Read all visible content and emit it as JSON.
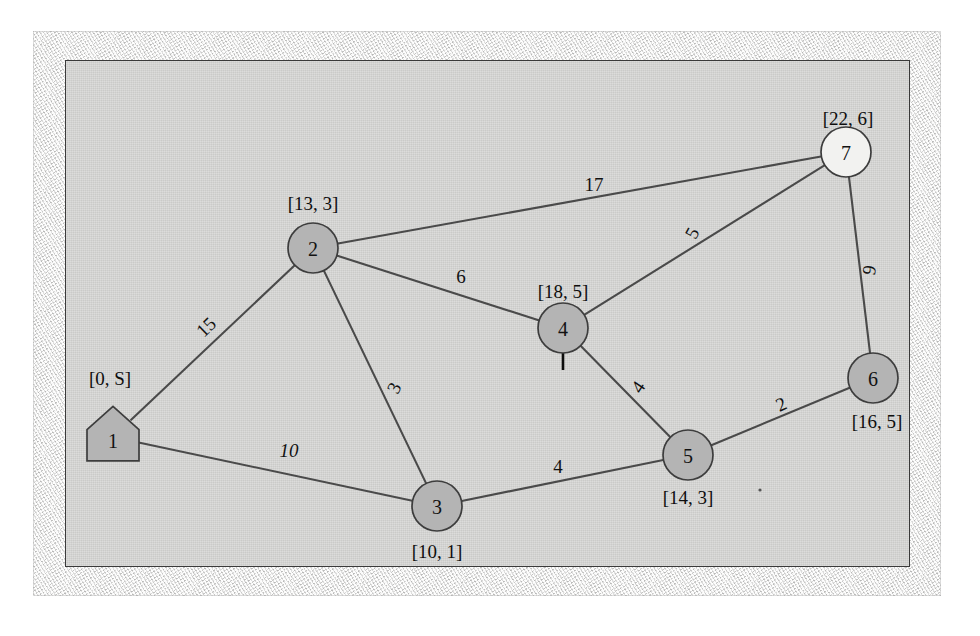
{
  "figure": {
    "kind": "weighted-undirected-graph",
    "caption": "",
    "colors": {
      "node_fill": "#b4b4b4",
      "node_open_fill": "#f2f2f0",
      "node_stroke": "#3d3d3d",
      "edge_stroke": "#4a4a4a",
      "plate_background": "#d4d4d2",
      "frame_background": "#e9e9e7",
      "text": "#111111"
    }
  },
  "chart_data": {
    "type": "diagram",
    "title": "",
    "nodes": [
      {
        "id": "1",
        "label": "1",
        "annotation": "[0, S]",
        "shape": "pentagon",
        "fill": "shaded",
        "x": 113,
        "y": 437,
        "r": 26,
        "annotation_x": 110,
        "annotation_y": 378
      },
      {
        "id": "2",
        "label": "2",
        "annotation": "[13, 3]",
        "shape": "circle",
        "fill": "shaded",
        "x": 313,
        "y": 248,
        "r": 25,
        "annotation_x": 313,
        "annotation_y": 203
      },
      {
        "id": "3",
        "label": "3",
        "annotation": "[10, 1]",
        "shape": "circle",
        "fill": "shaded",
        "x": 437,
        "y": 506,
        "r": 25,
        "annotation_x": 437,
        "annotation_y": 551
      },
      {
        "id": "4",
        "label": "4",
        "annotation": "[18, 5]",
        "shape": "circle",
        "fill": "shaded",
        "x": 563,
        "y": 328,
        "r": 25,
        "annotation_x": 563,
        "annotation_y": 291
      },
      {
        "id": "5",
        "label": "5",
        "annotation": "[14, 3]",
        "shape": "circle",
        "fill": "shaded",
        "x": 688,
        "y": 455,
        "r": 25,
        "annotation_x": 688,
        "annotation_y": 497
      },
      {
        "id": "6",
        "label": "6",
        "annotation": "[16, 5]",
        "shape": "circle",
        "fill": "shaded",
        "x": 873,
        "y": 378,
        "r": 25,
        "annotation_x": 877,
        "annotation_y": 421
      },
      {
        "id": "7",
        "label": "7",
        "annotation": "[22, 6]",
        "shape": "circle",
        "fill": "open",
        "x": 846,
        "y": 152,
        "r": 25,
        "annotation_x": 848,
        "annotation_y": 118
      }
    ],
    "edges": [
      {
        "source": "1",
        "target": "2",
        "weight": "15",
        "label_x": 206,
        "label_y": 327,
        "rotation": -44,
        "italic": false
      },
      {
        "source": "1",
        "target": "3",
        "weight": "10",
        "label_x": 289,
        "label_y": 450,
        "rotation": 0,
        "italic": true
      },
      {
        "source": "2",
        "target": "3",
        "weight": "3",
        "label_x": 394,
        "label_y": 388,
        "rotation": -64,
        "italic": false
      },
      {
        "source": "2",
        "target": "4",
        "weight": "6",
        "label_x": 461,
        "label_y": 276,
        "rotation": 0,
        "italic": false
      },
      {
        "source": "2",
        "target": "7",
        "weight": "17",
        "label_x": 594,
        "label_y": 184,
        "rotation": 0,
        "italic": false
      },
      {
        "source": "4",
        "target": "7",
        "weight": "5",
        "label_x": 692,
        "label_y": 233,
        "rotation": -62,
        "italic": false
      },
      {
        "source": "7",
        "target": "6",
        "weight": "9",
        "label_x": 869,
        "label_y": 270,
        "rotation": -81,
        "italic": false
      },
      {
        "source": "4",
        "target": "5",
        "weight": "4",
        "label_x": 638,
        "label_y": 387,
        "rotation": -56,
        "italic": false
      },
      {
        "source": "3",
        "target": "5",
        "weight": "4",
        "label_x": 558,
        "label_y": 466,
        "rotation": 0,
        "italic": false
      },
      {
        "source": "5",
        "target": "6",
        "weight": "2",
        "label_x": 781,
        "label_y": 404,
        "rotation": -25,
        "italic": false
      }
    ],
    "annotations": [
      {
        "kind": "arrow",
        "name": "current-node-pointer",
        "points_to": "4",
        "x": 563,
        "y": 370,
        "length": 33,
        "direction": "up"
      }
    ]
  }
}
